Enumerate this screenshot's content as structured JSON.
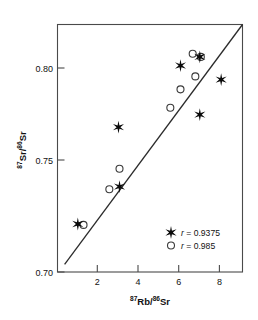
{
  "chart_data": {
    "type": "scatter",
    "title": "",
    "xlabel": "87Rb/86Sr",
    "ylabel": "87Sr/86Sr",
    "xlabel_parts": {
      "sup1": "87",
      "mid": "Rb/",
      "sup2": "86",
      "end": "Sr"
    },
    "ylabel_parts": {
      "sup1": "87",
      "mid": "Sr/",
      "sup2": "86",
      "end": "Sr"
    },
    "xlim": [
      0,
      9.1
    ],
    "ylim": [
      0.7,
      0.8145
    ],
    "xticks": [
      2,
      4,
      6,
      8
    ],
    "xtick_labels": [
      "2",
      "4",
      "6",
      "8"
    ],
    "yticks": [
      0.7,
      0.75,
      0.8
    ],
    "ytick_labels": [
      "0.70",
      "0.75",
      "0.80"
    ],
    "grid": false,
    "legend_position": "lower-right",
    "series": [
      {
        "name": "r = 0.9375",
        "marker": "star",
        "color": "#0a0a0a",
        "points": [
          {
            "x": 1.0,
            "y": 0.7222
          },
          {
            "x": 3.05,
            "y": 0.7395
          },
          {
            "x": 3.0,
            "y": 0.767
          },
          {
            "x": 6.05,
            "y": 0.7955
          },
          {
            "x": 7.0,
            "y": 0.7995
          },
          {
            "x": 7.0,
            "y": 0.7728
          },
          {
            "x": 8.05,
            "y": 0.789
          }
        ]
      },
      {
        "name": "r = 0.985",
        "marker": "open-circle",
        "color": "#3a3a3a",
        "points": [
          {
            "x": 1.28,
            "y": 0.7218
          },
          {
            "x": 2.55,
            "y": 0.7383
          },
          {
            "x": 3.05,
            "y": 0.7478
          },
          {
            "x": 5.55,
            "y": 0.776
          },
          {
            "x": 6.05,
            "y": 0.7845
          },
          {
            "x": 6.65,
            "y": 0.801
          },
          {
            "x": 6.78,
            "y": 0.7905
          },
          {
            "x": 7.05,
            "y": 0.7995
          }
        ]
      }
    ],
    "fit_line": {
      "x0": 0.35,
      "y0": 0.7035,
      "x1": 9.1,
      "y1": 0.8145
    },
    "legend": [
      {
        "marker": "star",
        "label_italic": "r",
        "label": " = 0.9375"
      },
      {
        "marker": "open-circle",
        "label_italic": "r",
        "label": " = 0.985"
      }
    ]
  }
}
